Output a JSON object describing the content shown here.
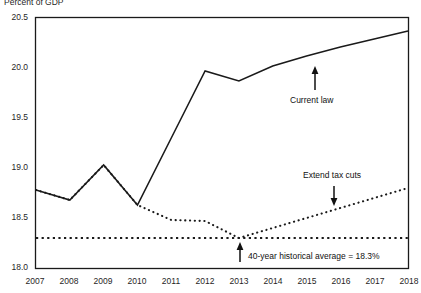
{
  "chart_data": {
    "type": "line",
    "title": "",
    "ylabel": "Percent of GDP",
    "xlabel": "",
    "ylim": [
      18.0,
      20.5
    ],
    "xlim": [
      2007,
      2018
    ],
    "grid": false,
    "legend_position": "inline-annotations",
    "yticks": [
      "20.5",
      "20.0",
      "19.5",
      "19.0",
      "18.5",
      "18.0"
    ],
    "ytick_values": [
      20.5,
      20.0,
      19.5,
      19.0,
      18.5,
      18.0
    ],
    "x": [
      2007,
      2008,
      2009,
      2010,
      2011,
      2012,
      2013,
      2014,
      2015,
      2016,
      2017,
      2018
    ],
    "xticks": [
      "2007",
      "2008",
      "2009",
      "2010",
      "2011",
      "2012",
      "2013",
      "2014",
      "2015",
      "2016",
      "2017",
      "2018"
    ],
    "series": [
      {
        "name": "Current law",
        "style": "solid",
        "color": "#1a1a1a",
        "values": [
          18.78,
          18.68,
          19.03,
          18.63,
          19.3,
          19.97,
          19.87,
          20.02,
          20.12,
          20.21,
          20.29,
          20.37
        ]
      },
      {
        "name": "Extend tax cuts",
        "style": "dotted",
        "color": "#1a1a1a",
        "values": [
          18.78,
          18.68,
          19.03,
          18.63,
          18.48,
          18.47,
          18.3,
          18.4,
          18.5,
          18.6,
          18.7,
          18.8
        ]
      },
      {
        "name": "40-year historical average",
        "style": "dotted-horizontal",
        "color": "#1a1a1a",
        "values": [
          18.3,
          18.3,
          18.3,
          18.3,
          18.3,
          18.3,
          18.3,
          18.3,
          18.3,
          18.3,
          18.3,
          18.3
        ]
      }
    ],
    "annotations": [
      {
        "id": "current-law",
        "text": "Current law",
        "arrow": "up",
        "points_to_series": "Current law"
      },
      {
        "id": "extend-tax-cuts",
        "text": "Extend tax cuts",
        "arrow": "down",
        "points_to_series": "Extend tax cuts"
      },
      {
        "id": "historical-average",
        "text": "40-year historical average = 18.3%",
        "arrow": "up",
        "points_to_series": "40-year historical average"
      }
    ]
  },
  "labels": {
    "axis_title": "Percent of GDP",
    "annot_current_law": "Current law",
    "annot_extend_tax_cuts": "Extend tax cuts",
    "annot_historical_average": "40-year historical average = 18.3%"
  },
  "colors": {
    "line": "#1a1a1a",
    "frame": "#1a1a1a",
    "background": "#ffffff"
  }
}
